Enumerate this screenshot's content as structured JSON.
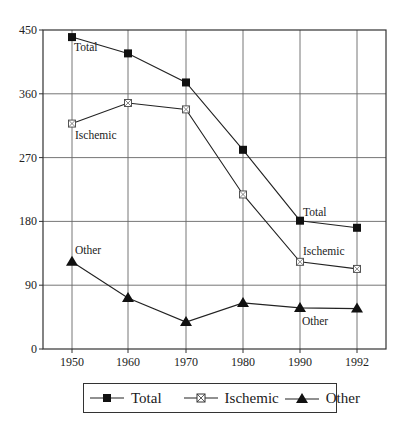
{
  "chart_data": {
    "type": "line",
    "title": "",
    "xlabel": "",
    "ylabel": "",
    "x": [
      "1950",
      "1960",
      "1970",
      "1980",
      "1990",
      "1992"
    ],
    "ylim": [
      0,
      450
    ],
    "yticks": [
      0,
      90,
      180,
      270,
      360,
      450
    ],
    "grid": true,
    "legend_position": "bottom",
    "series": [
      {
        "name": "Total",
        "marker": "filled-square",
        "values": [
          440,
          417,
          376,
          281,
          181,
          171
        ]
      },
      {
        "name": "Ischemic",
        "marker": "crossed-open-square",
        "values": [
          318,
          347,
          338,
          218,
          123,
          113
        ]
      },
      {
        "name": "Other",
        "marker": "filled-triangle",
        "values": [
          123,
          72,
          38,
          65,
          58,
          57
        ]
      }
    ],
    "annotations": [
      {
        "text": "Total",
        "x": "1950",
        "series": "Total"
      },
      {
        "text": "Ischemic",
        "x": "1950",
        "series": "Ischemic"
      },
      {
        "text": "Other",
        "x": "1950",
        "series": "Other"
      },
      {
        "text": "Total",
        "x": "1990",
        "series": "Total"
      },
      {
        "text": "Ischemic",
        "x": "1990",
        "series": "Ischemic"
      },
      {
        "text": "Other",
        "x": "1990",
        "series": "Other"
      }
    ]
  },
  "legend": {
    "items": [
      {
        "label": "Total"
      },
      {
        "label": "Ischemic"
      },
      {
        "label": "Other"
      }
    ]
  }
}
